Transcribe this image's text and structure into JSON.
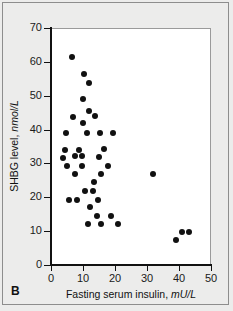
{
  "figure": {
    "panel_label": "B",
    "background_color": "#ececeb",
    "plot_background_color": "#ffffff",
    "marker_color": "#111111",
    "axis_color": "#111111"
  },
  "chart_data": {
    "type": "scatter",
    "title": "",
    "xlabel": "Fasting serum insulin,",
    "xlabel_unit": "mU/L",
    "ylabel": "SHBG level,",
    "ylabel_unit": "nmol/L",
    "xlim": [
      0,
      50
    ],
    "ylim": [
      0,
      70
    ],
    "xticks": [
      0,
      10,
      20,
      30,
      40,
      50
    ],
    "yticks": [
      0,
      10,
      20,
      30,
      40,
      50,
      60,
      70
    ],
    "grid": false,
    "legend": null,
    "series": [
      {
        "name": "subjects",
        "points": [
          [
            6.6,
            61.5
          ],
          [
            10.3,
            56.5
          ],
          [
            11.9,
            53.7
          ],
          [
            10.0,
            48.9
          ],
          [
            11.9,
            45.6
          ],
          [
            6.9,
            43.8
          ],
          [
            13.8,
            44.0
          ],
          [
            10.0,
            41.8
          ],
          [
            4.7,
            39.1
          ],
          [
            11.3,
            39.1
          ],
          [
            15.3,
            39.1
          ],
          [
            19.3,
            39.1
          ],
          [
            4.4,
            34.0
          ],
          [
            8.8,
            34.0
          ],
          [
            16.6,
            34.3
          ],
          [
            3.9,
            31.6
          ],
          [
            7.6,
            32.1
          ],
          [
            9.8,
            32.1
          ],
          [
            15.0,
            31.9
          ],
          [
            5.0,
            29.3
          ],
          [
            9.6,
            29.2
          ],
          [
            17.8,
            29.2
          ],
          [
            7.4,
            26.8
          ],
          [
            15.6,
            26.8
          ],
          [
            32.0,
            27.0
          ],
          [
            13.3,
            24.4
          ],
          [
            10.7,
            21.9
          ],
          [
            13.1,
            21.9
          ],
          [
            5.6,
            19.3
          ],
          [
            8.1,
            19.3
          ],
          [
            14.6,
            19.3
          ],
          [
            12.2,
            17.0
          ],
          [
            14.3,
            14.6
          ],
          [
            18.8,
            14.4
          ],
          [
            11.6,
            12.2
          ],
          [
            15.6,
            12.2
          ],
          [
            20.9,
            12.0
          ],
          [
            40.9,
            9.7
          ],
          [
            43.0,
            9.7
          ],
          [
            39.0,
            7.5
          ]
        ]
      }
    ]
  }
}
